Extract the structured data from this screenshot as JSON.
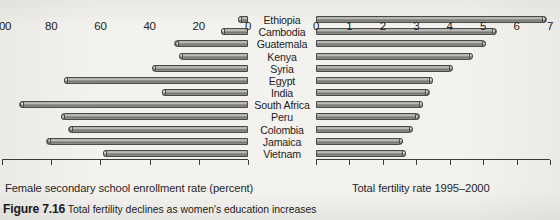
{
  "figure": {
    "number_label": "Figure 7.16",
    "caption_text": "Total fertility declines as women's education increases"
  },
  "countries": [
    "Ethiopia",
    "Cambodia",
    "Guatemala",
    "Kenya",
    "Syria",
    "Egypt",
    "India",
    "South Africa",
    "Peru",
    "Colombia",
    "Jamaica",
    "Vietnam"
  ],
  "left_axis": {
    "title": "Female secondary school enrollment rate (percent)",
    "ticks": [
      100,
      80,
      60,
      40,
      20,
      0
    ],
    "min": 0,
    "max": 100,
    "reversed": true
  },
  "right_axis": {
    "title": "Total fertility rate 1995–2000",
    "ticks": [
      0,
      1,
      2,
      3,
      4,
      5,
      6,
      7
    ],
    "min": 0,
    "max": 7,
    "reversed": false
  },
  "chart_data": {
    "type": "bar",
    "title": "Total fertility declines as women's education increases",
    "orientation": "horizontal",
    "layout": "back-to-back paired panels sharing category axis",
    "grid": false,
    "legend": "none",
    "categories": [
      "Ethiopia",
      "Cambodia",
      "Guatemala",
      "Kenya",
      "Syria",
      "Egypt",
      "India",
      "South Africa",
      "Peru",
      "Colombia",
      "Jamaica",
      "Vietnam"
    ],
    "series": [
      {
        "name": "Female secondary school enrollment rate (percent)",
        "panel": "left",
        "xlabel": "Female secondary school enrollment rate (percent)",
        "ylabel": "",
        "xlim": [
          100,
          0
        ],
        "direction": "right-to-left",
        "values": [
          4,
          11,
          30,
          28,
          39,
          75,
          35,
          93,
          76,
          73,
          82,
          59
        ]
      },
      {
        "name": "Total fertility rate 1995–2000",
        "panel": "right",
        "xlabel": "Total fertility rate 1995–2000",
        "ylabel": "",
        "xlim": [
          0,
          7
        ],
        "direction": "left-to-right",
        "values": [
          6.9,
          5.4,
          5.1,
          4.7,
          4.1,
          3.5,
          3.4,
          3.2,
          3.1,
          2.9,
          2.6,
          2.7
        ]
      }
    ]
  }
}
